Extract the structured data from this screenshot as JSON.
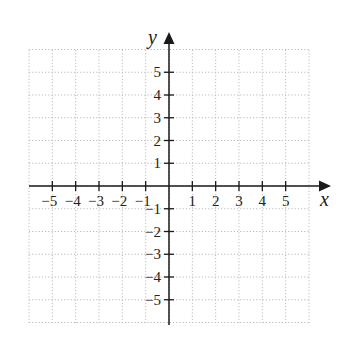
{
  "diagram": {
    "type": "coordinate-plane",
    "x_axis": {
      "label": "x",
      "min": -6,
      "max": 6,
      "tick_labels": [
        "−5",
        "−4",
        "−3",
        "−2",
        "−1",
        "1",
        "2",
        "3",
        "4",
        "5"
      ],
      "tick_values": [
        -5,
        -4,
        -3,
        -2,
        -1,
        1,
        2,
        3,
        4,
        5
      ]
    },
    "y_axis": {
      "label": "y",
      "min": -6,
      "max": 6,
      "tick_labels": [
        "5",
        "4",
        "3",
        "2",
        "1",
        "−1",
        "−2",
        "−3",
        "−4",
        "−5"
      ],
      "tick_values": [
        5,
        4,
        3,
        2,
        1,
        -1,
        -2,
        -3,
        -4,
        -5
      ]
    },
    "grid": {
      "style": "dotted",
      "color": "#bbbbbb",
      "cells": 12
    },
    "axis_color": "#1a1a1a"
  }
}
